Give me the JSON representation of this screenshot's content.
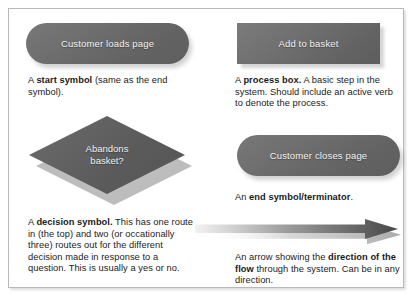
{
  "figure": {
    "panel_border_color": "#b9b9b9",
    "shape_fill_color": "#666666",
    "shape_text_color": "#f2f2f2",
    "shape_shadow_color": "#bdbdbd",
    "arrow_gradient_from": "#f0f0f0",
    "arrow_gradient_to": "#4a4a4a"
  },
  "items": {
    "start_symbol": {
      "shape_label": "Customer loads page",
      "caption_lead": "A ",
      "caption_bold": "start symbol",
      "caption_rest": " (same as the end symbol)."
    },
    "process_box": {
      "shape_label": "Add to basket",
      "caption_lead": "A ",
      "caption_bold": "process box.",
      "caption_rest": " A basic step in the system. Should include an active verb to denote the process."
    },
    "decision_symbol": {
      "shape_label_line1": "Abandons",
      "shape_label_line2": "basket?",
      "caption_lead": "A ",
      "caption_bold": "decision symbol.",
      "caption_rest": " This has one route in (the top) and two (or occationally three) routes out for the different decision made in response to a question. This is usually a yes or no."
    },
    "end_symbol": {
      "shape_label": "Customer closes page",
      "caption_lead": "An ",
      "caption_bold": "end symbol/terminator",
      "caption_rest": "."
    },
    "flow_arrow": {
      "caption_lead": "An arrow showing the ",
      "caption_bold": "direction of the flow",
      "caption_rest": " through the system. Can be in any direction."
    }
  }
}
